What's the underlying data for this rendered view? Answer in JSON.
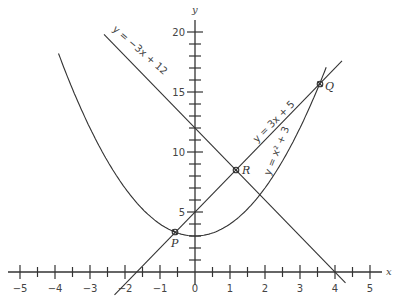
{
  "chart_data": {
    "type": "line",
    "title": "",
    "xlabel": "x",
    "ylabel": "y",
    "xlim": [
      -5,
      5
    ],
    "ylim": [
      0,
      20
    ],
    "x_ticks": [
      -5,
      -4,
      -3,
      -2,
      -1,
      0,
      1,
      2,
      3,
      4,
      5
    ],
    "x_minor_step": 0.5,
    "y_ticks": [
      5,
      10,
      15,
      20
    ],
    "y_minor_step": 1,
    "grid": false,
    "series": [
      {
        "name": "y = x² + 3",
        "kind": "parabola",
        "a": 1,
        "b": 0,
        "c": 3,
        "x_range": [
          -3.9,
          3.75
        ]
      },
      {
        "name": "y = 3x + 5",
        "kind": "line",
        "slope": 3,
        "intercept": 5,
        "x_range": [
          -2.3,
          4.2
        ]
      },
      {
        "name": "y = −3x + 12",
        "kind": "line",
        "slope": -3,
        "intercept": 12,
        "x_range": [
          -2.6,
          4.3
        ]
      }
    ],
    "points": [
      {
        "label": "P",
        "x": -0.56,
        "y": 3.32
      },
      {
        "label": "R",
        "x": 1.17,
        "y": 8.5
      },
      {
        "label": "Q",
        "x": 3.56,
        "y": 15.68
      }
    ]
  },
  "labels": {
    "x_axis": "x",
    "y_axis": "y",
    "eq_parabola": "y = x² + 3",
    "eq_line_pos": "y = 3x + 5",
    "eq_line_neg": "y = −3x + 12",
    "pt_p": "P",
    "pt_q": "Q",
    "pt_r": "R",
    "xt": [
      "−5",
      "−4",
      "−3",
      "−2",
      "−1",
      "0",
      "1",
      "2",
      "3",
      "4",
      "5"
    ],
    "yt": [
      "5",
      "10",
      "15",
      "20"
    ]
  }
}
